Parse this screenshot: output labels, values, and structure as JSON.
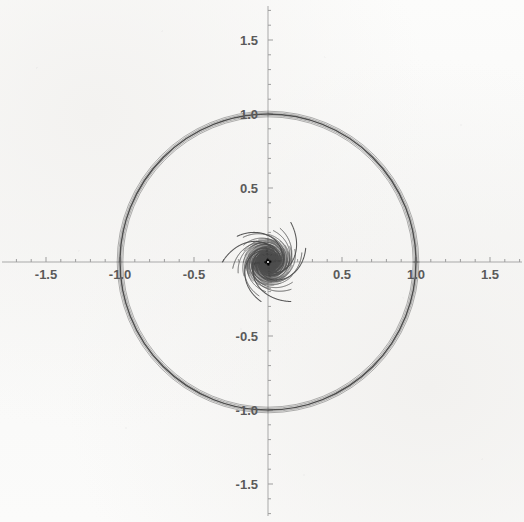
{
  "figure": {
    "kind": "mathematica-parametric-plot",
    "background_color": "#faf9f8",
    "curve_color": "#4a4a4a",
    "axis_color": "#a8a8a8",
    "label_color": "#5a5a5a"
  },
  "axes": {
    "origin_px": [
      268,
      262
    ],
    "pixels_per_unit": 148,
    "x_label_texts": [
      "-1.5",
      "-1.0",
      "-0.5",
      "0.5",
      "1.0",
      "1.5"
    ],
    "y_label_texts": [
      "1.5",
      "1.0",
      "0.5",
      "-0.5",
      "-1.0",
      "-1.5"
    ],
    "x_ticks_major": [
      -1.5,
      -1.0,
      -0.5,
      0.5,
      1.0,
      1.5
    ],
    "y_ticks_major": [
      1.5,
      1.0,
      0.5,
      -0.5,
      -1.0,
      -1.5
    ],
    "minor_tick_step": 0.1,
    "x_range": [
      -1.81,
      1.73
    ],
    "y_range": [
      -1.76,
      1.77
    ],
    "grid": false,
    "spine_style": "crossed-at-origin"
  },
  "chart_data": {
    "type": "line",
    "title": "",
    "subtitle": "",
    "xlabel": "",
    "ylabel": "",
    "xlim": [
      -1.81,
      1.73
    ],
    "ylim": [
      -1.76,
      1.77
    ],
    "grid": false,
    "legend": "none",
    "symmetry_order": 3,
    "arm_phase_offsets_deg": [
      0,
      120,
      240
    ],
    "spiral_model": "r(t) = r0 * exp(k*t), polar",
    "annotations": [],
    "series": [
      {
        "name": "arm-1-winding-1",
        "polar": {
          "r0": 0.012,
          "k": 0.62,
          "theta_start_deg": 0,
          "theta_end_deg": 300,
          "phase_deg": 0
        }
      },
      {
        "name": "arm-2-winding-1",
        "polar": {
          "r0": 0.012,
          "k": 0.62,
          "theta_start_deg": 0,
          "theta_end_deg": 300,
          "phase_deg": 120
        }
      },
      {
        "name": "arm-3-winding-1",
        "polar": {
          "r0": 0.012,
          "k": 0.62,
          "theta_start_deg": 0,
          "theta_end_deg": 300,
          "phase_deg": 240
        }
      },
      {
        "name": "arm-1-winding-2",
        "polar": {
          "r0": 0.012,
          "k": 0.4,
          "theta_start_deg": 0,
          "theta_end_deg": 430,
          "phase_deg": 0
        }
      },
      {
        "name": "arm-2-winding-2",
        "polar": {
          "r0": 0.012,
          "k": 0.4,
          "theta_start_deg": 0,
          "theta_end_deg": 430,
          "phase_deg": 120
        }
      },
      {
        "name": "arm-3-winding-2",
        "polar": {
          "r0": 0.012,
          "k": 0.4,
          "theta_start_deg": 0,
          "theta_end_deg": 430,
          "phase_deg": 240
        }
      },
      {
        "name": "arm-1-winding-3",
        "polar": {
          "r0": 0.012,
          "k": 0.295,
          "theta_start_deg": 0,
          "theta_end_deg": 560,
          "phase_deg": 0
        }
      },
      {
        "name": "arm-2-winding-3",
        "polar": {
          "r0": 0.012,
          "k": 0.295,
          "theta_start_deg": 0,
          "theta_end_deg": 560,
          "phase_deg": 120
        }
      },
      {
        "name": "arm-3-winding-3",
        "polar": {
          "r0": 0.012,
          "k": 0.295,
          "theta_start_deg": 0,
          "theta_end_deg": 560,
          "phase_deg": 240
        }
      },
      {
        "name": "limit-ring-bundle",
        "note": "dense accumulation of windings forming the dark circle",
        "radius": 1.0,
        "thickness_units": 0.035
      },
      {
        "name": "escape-arm-upper-left",
        "endpoint_px": [
          70,
          30
        ]
      },
      {
        "name": "escape-arm-upper-right",
        "endpoint_px": [
          500,
          63
        ]
      },
      {
        "name": "escape-arm-lower-left",
        "endpoint_px": [
          68,
          462
        ]
      }
    ]
  }
}
